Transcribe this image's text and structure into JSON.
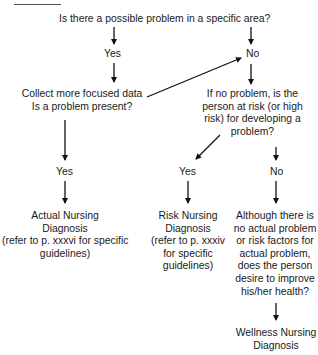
{
  "flowchart": {
    "question_1": "Is there a possible problem in a specific area?",
    "q1_yes": "Yes",
    "q1_no": "No",
    "collect_line1": "Collect more focused data",
    "collect_line2": "Is a problem present?",
    "risk_q_line1": "If no problem, is the",
    "risk_q_line2": "person at risk (or high",
    "risk_q_line3": "risk) for developing a",
    "risk_q_line4": "problem?",
    "collect_yes": "Yes",
    "risk_yes": "Yes",
    "risk_no": "No",
    "actual": {
      "line1": "Actual Nursing",
      "line2": "Diagnosis",
      "line3": "(refer to p. xxxvi for specific",
      "line4": "guidelines)"
    },
    "risk": {
      "line1": "Risk Nursing",
      "line2": "Diagnosis",
      "line3": "(refer to p. xxxiv",
      "line4": "for specific",
      "line5": "guidelines)"
    },
    "wellness_q": {
      "line1": "Although there is",
      "line2": "no actual problem",
      "line3": "or risk factors for",
      "line4": "actual problem,",
      "line5": "does the person",
      "line6": "desire to improve",
      "line7": "his/her health?"
    },
    "wellness": {
      "line1": "Wellness Nursing",
      "line2": "Diagnosis"
    }
  }
}
